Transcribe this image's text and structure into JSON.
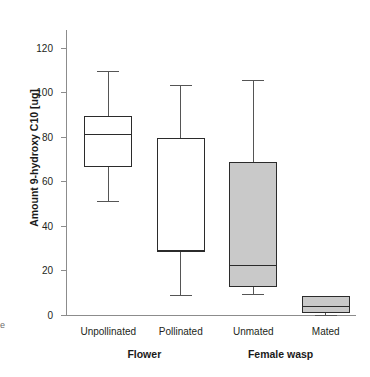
{
  "fragments": {
    "top_clipped_caption": "",
    "left_edge_glyph": "e"
  },
  "axis": {
    "y_title": "Amount 9-hydroxy C10 [ug]",
    "y_ticks": [
      "0",
      "20",
      "40",
      "60",
      "80",
      "100",
      "120"
    ]
  },
  "groups": [
    {
      "label": "Flower",
      "center_pct": 27
    },
    {
      "label": "Female wasp",
      "center_pct": 74
    }
  ],
  "chart_data": {
    "type": "box",
    "title": "",
    "xlabel": "",
    "ylabel": "Amount 9-hydroxy C10 [ug]",
    "ylim": [
      0,
      128
    ],
    "ytick_values": [
      0,
      20,
      40,
      60,
      80,
      100,
      120
    ],
    "grid": false,
    "legend": "none",
    "group_labels": [
      "Flower",
      "Female wasp"
    ],
    "categories": [
      "Unpollinated",
      "Pollinated",
      "Unmated",
      "Mated"
    ],
    "boxes": [
      {
        "category": "Unpollinated",
        "group": "Flower",
        "min": 51.0,
        "q1": 66.5,
        "median": 81.5,
        "q3": 89.5,
        "max": 109.5,
        "fill": "white",
        "fill_color": "#ffffff"
      },
      {
        "category": "Pollinated",
        "group": "Flower",
        "min": 8.8,
        "q1": 28.7,
        "median": 28.7,
        "q3": 79.5,
        "max": 103.5,
        "fill": "white",
        "fill_color": "#ffffff"
      },
      {
        "category": "Unmated",
        "group": "Female wasp",
        "min": 9.5,
        "q1": 12.5,
        "median": 22.4,
        "q3": 68.8,
        "max": 105.5,
        "fill": "gray",
        "fill_color": "#c9c9c9"
      },
      {
        "category": "Mated",
        "group": "Female wasp",
        "min": 0.0,
        "q1": 0.8,
        "median": 4.2,
        "q3": 8.6,
        "max": 8.6,
        "fill": "gray",
        "fill_color": "#c9c9c9"
      }
    ]
  }
}
